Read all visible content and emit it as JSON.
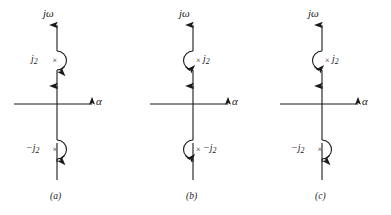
{
  "figure": {
    "type": "complex-plane-contour-diagram",
    "background_color": "#ffffff",
    "line_color": "#1a1a1a",
    "axis_labels": {
      "imaginary": "jω",
      "real": "α"
    },
    "pole_marker": "×",
    "panels": [
      {
        "id": "a",
        "caption": "(a)",
        "axis_imaginary_label": "jω",
        "axis_real_label": "α",
        "poles": [
          {
            "label_main": "j",
            "label_sub": "2",
            "label_prefix": "",
            "position": "upper",
            "marker": "×",
            "label_side": "left",
            "indent_side": "right"
          },
          {
            "label_main": "j",
            "label_sub": "2",
            "label_prefix": "−",
            "position": "lower",
            "marker": "×",
            "label_side": "left",
            "indent_side": "right"
          }
        ]
      },
      {
        "id": "b",
        "caption": "(b)",
        "axis_imaginary_label": "jω",
        "axis_real_label": "α",
        "poles": [
          {
            "label_main": "j",
            "label_sub": "2",
            "label_prefix": "",
            "position": "upper",
            "marker": "×",
            "label_side": "right",
            "indent_side": "left"
          },
          {
            "label_main": "j",
            "label_sub": "2",
            "label_prefix": "−",
            "position": "lower",
            "marker": "×",
            "label_side": "right",
            "indent_side": "left"
          }
        ]
      },
      {
        "id": "c",
        "caption": "(c)",
        "axis_imaginary_label": "jω",
        "axis_real_label": "α",
        "poles": [
          {
            "label_main": "j",
            "label_sub": "2",
            "label_prefix": "",
            "position": "upper",
            "marker": "×",
            "label_side": "right",
            "indent_side": "left"
          },
          {
            "label_main": "j",
            "label_sub": "2",
            "label_prefix": "−",
            "position": "lower",
            "marker": "×",
            "label_side": "left",
            "indent_side": "right"
          }
        ]
      }
    ]
  }
}
